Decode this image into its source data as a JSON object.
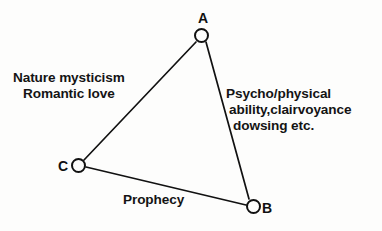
{
  "diagram": {
    "type": "triangle-node-diagram",
    "background_color": "#fdfdfc",
    "stroke_color": "#111111",
    "text_color": "#141414",
    "nodes": [
      {
        "id": "A",
        "label": "A",
        "cx": 201,
        "cy": 35,
        "r": 7.5,
        "label_position": "above"
      },
      {
        "id": "C",
        "label": "C",
        "cx": 78,
        "cy": 165,
        "r": 7.5,
        "label_position": "left"
      },
      {
        "id": "B",
        "label": "B",
        "cx": 253,
        "cy": 206,
        "r": 7.5,
        "label_position": "right"
      }
    ],
    "edges": [
      {
        "from": "A",
        "to": "C",
        "label_lines": [
          "Nature mysticism",
          "Romantic love"
        ],
        "x1": 196,
        "y1": 42,
        "x2": 84,
        "y2": 160
      },
      {
        "from": "A",
        "to": "B",
        "label_lines": [
          "Psycho/physical",
          "ability,clairvoyance",
          "dowsing etc."
        ],
        "x1": 206,
        "y1": 42,
        "x2": 249,
        "y2": 199
      },
      {
        "from": "C",
        "to": "B",
        "label_lines": [
          "Prophecy"
        ],
        "x1": 86,
        "y1": 167,
        "x2": 246,
        "y2": 205
      }
    ]
  },
  "labels": {
    "nature_mysticism_line1": "Nature mysticism",
    "nature_mysticism_line2": "Romantic love",
    "psycho_line1": "Psycho/physical",
    "psycho_line2": "ability,clairvoyance",
    "psycho_line3": "dowsing etc.",
    "prophecy": "Prophecy",
    "node_a": "A",
    "node_b": "B",
    "node_c": "C"
  }
}
